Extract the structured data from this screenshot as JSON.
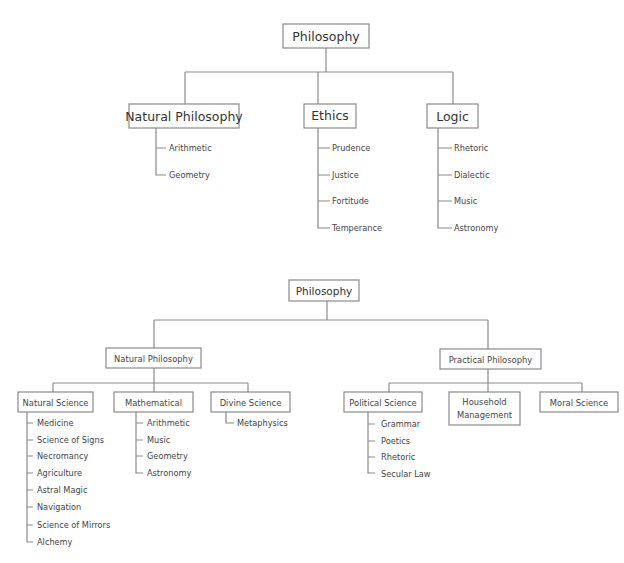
{
  "diagrams": [
    {
      "name": "top-tree",
      "root": "Philosophy",
      "children": [
        {
          "label": "Natural Philosophy",
          "items": [
            "Arithmetic",
            "Geometry"
          ]
        },
        {
          "label": "Ethics",
          "items": [
            "Prudence",
            "Justice",
            "Fortitude",
            "Temperance"
          ]
        },
        {
          "label": "Logic",
          "items": [
            "Rhetoric",
            "Dialectic",
            "Music",
            "Astronomy"
          ]
        }
      ]
    },
    {
      "name": "bottom-tree",
      "root": "Philosophy",
      "children": [
        {
          "label": "Natural Philosophy",
          "children": [
            {
              "label": "Natural Science",
              "items": [
                "Medicine",
                "Science of Signs",
                "Necromancy",
                "Agriculture",
                "Astral Magic",
                "Navigation",
                "Science of Mirrors",
                "Alchemy"
              ]
            },
            {
              "label": "Mathematical",
              "items": [
                "Arithmetic",
                "Music",
                "Geometry",
                "Astronomy"
              ]
            },
            {
              "label": "Divine Science",
              "items": [
                "Metaphysics"
              ]
            }
          ]
        },
        {
          "label": "Practical Philosophy",
          "children": [
            {
              "label": "Political Science",
              "items": [
                "Grammar",
                "Poetics",
                "Rhetoric",
                "Secular Law"
              ]
            },
            {
              "label": "Household Management",
              "label_lines": [
                "Household",
                "Management"
              ],
              "items": []
            },
            {
              "label": "Moral Science",
              "items": []
            }
          ]
        }
      ]
    }
  ]
}
